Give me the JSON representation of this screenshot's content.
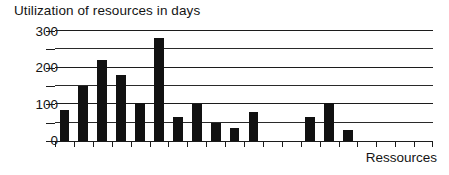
{
  "chart_data": {
    "type": "bar",
    "title": "Utilization of resources in days",
    "xlabel": "Ressources",
    "ylabel": "",
    "ylim": [
      0,
      300
    ],
    "grid": true,
    "legend": "none",
    "y_major_ticks": [
      0,
      100,
      200,
      300
    ],
    "y_minor_ticks": [
      50,
      150,
      250
    ],
    "y_tick_labels": [
      "0",
      "100",
      "200",
      "300"
    ],
    "categories": [
      "1",
      "2",
      "3",
      "4",
      "5",
      "6",
      "7",
      "8",
      "9",
      "10",
      "11",
      "12",
      "13",
      "14",
      "15",
      "16",
      "17",
      "18",
      "19",
      "20"
    ],
    "values": [
      85,
      150,
      220,
      180,
      105,
      280,
      65,
      100,
      50,
      35,
      78,
      0,
      0,
      65,
      105,
      30,
      0,
      0,
      0,
      0
    ],
    "bars": [
      {
        "index": 1,
        "value": 85
      },
      {
        "index": 2,
        "value": 150
      },
      {
        "index": 3,
        "value": 220
      },
      {
        "index": 4,
        "value": 180
      },
      {
        "index": 5,
        "value": 105
      },
      {
        "index": 6,
        "value": 280
      },
      {
        "index": 7,
        "value": 65
      },
      {
        "index": 8,
        "value": 100
      },
      {
        "index": 9,
        "value": 50
      },
      {
        "index": 10,
        "value": 35
      },
      {
        "index": 11,
        "value": 78
      },
      {
        "index": 14,
        "value": 65
      },
      {
        "index": 15,
        "value": 105
      },
      {
        "index": 16,
        "value": 30
      }
    ],
    "colors": {
      "bar": "#111111",
      "grid": "#2a2a2a",
      "axis": "#1c1c1c",
      "text": "#141414",
      "background": "#ffffff"
    }
  }
}
